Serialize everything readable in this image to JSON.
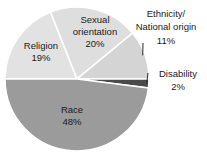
{
  "chart_data": {
    "type": "pie",
    "title": "",
    "categories": [
      "Religion",
      "Sexual orientation",
      "Ethnicity/National origin",
      "Disability",
      "Race"
    ],
    "values": [
      19,
      20,
      11,
      2,
      48
    ],
    "value_labels": [
      "19%",
      "20%",
      "11%",
      "2%",
      "48%"
    ],
    "units": "percent",
    "legend": "none",
    "grid": false,
    "start_angle_deg": 180,
    "direction": "clockwise",
    "colors": [
      "#e0e0e0",
      "#dcdcdc",
      "#d0d0d0",
      "#4d4d4d",
      "#9a9a9a"
    ],
    "separator_color": "#ffffff",
    "slices": [
      {
        "name": "Religion",
        "value": 19,
        "label": "Religion",
        "value_label": "19%",
        "color": "#e2e2e2",
        "label_placement": "inside"
      },
      {
        "name": "Sexual orientation",
        "value": 20,
        "label_line1": "Sexual",
        "label_line2": "orientation",
        "value_label": "20%",
        "color": "#dedede",
        "label_placement": "inside"
      },
      {
        "name": "Ethnicity/National origin",
        "value": 11,
        "label_line1": "Ethnicity/",
        "label_line2": "National origin",
        "value_label": "11%",
        "color": "#d4d4d4",
        "label_placement": "outside",
        "has_leader_line": true
      },
      {
        "name": "Disability",
        "value": 2,
        "label": "Disability",
        "value_label": "2%",
        "color": "#4a4a4a",
        "label_placement": "outside",
        "has_leader_line": true
      },
      {
        "name": "Race",
        "value": 48,
        "label": "Race",
        "value_label": "48%",
        "color": "#9b9b9b",
        "label_placement": "inside"
      }
    ]
  }
}
